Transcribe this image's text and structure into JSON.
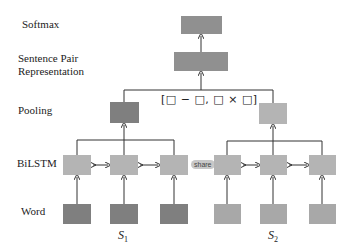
{
  "labels": {
    "softmax": "Softmax",
    "sentence_pair_line1": "Sentence Pair",
    "sentence_pair_line2": "Representation",
    "pooling": "Pooling",
    "bilstm": "BiLSTM",
    "word": "Word"
  },
  "formula": "[□ − □,  □ × □]",
  "share_label": "share",
  "sentences": [
    {
      "name": "S",
      "sub": "1"
    },
    {
      "name": "S",
      "sub": "2"
    }
  ],
  "colors": {
    "dark_box": "#7f7f7f",
    "light_box": "#b4b4b4",
    "line": "#333333"
  }
}
